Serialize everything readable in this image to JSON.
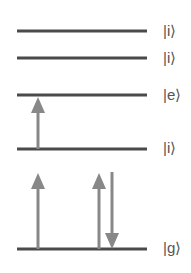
{
  "colors": {
    "level_line": "#4a4a4a",
    "arrow": "#888888",
    "label": "#555555",
    "background": "#ffffff"
  },
  "levels": [
    {
      "id": "i3",
      "label": "|i⟩",
      "y": 31
    },
    {
      "id": "i2",
      "label": "|i⟩",
      "y": 58
    },
    {
      "id": "e",
      "label": "|e⟩",
      "y": 95
    },
    {
      "id": "i1",
      "label": "|i⟩",
      "y": 149
    },
    {
      "id": "g",
      "label": "|g⟩",
      "y": 249
    }
  ],
  "level_x": {
    "start": 17,
    "end": 147
  },
  "arrows": [
    {
      "id": "g-to-i1",
      "direction": "up",
      "x": 38,
      "from_y": 249,
      "to_y": 173
    },
    {
      "id": "i1-to-e",
      "direction": "up",
      "x": 38,
      "from_y": 149,
      "to_y": 97
    },
    {
      "id": "g-to-i1-right",
      "direction": "up",
      "x": 99,
      "from_y": 249,
      "to_y": 173
    },
    {
      "id": "i1-to-g-right",
      "direction": "down",
      "x": 112,
      "from_y": 172,
      "to_y": 249
    }
  ]
}
